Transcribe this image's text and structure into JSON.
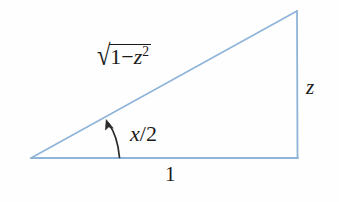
{
  "figure": {
    "kind": "right-triangle-geometry-diagram",
    "background_color": "#fefefe",
    "stroke_color": "#8fb4d9",
    "text_color": "#1a1a1a",
    "arrow_color": "#2b2b2b"
  },
  "labels": {
    "hypotenuse": {
      "text": "√(1−z²)",
      "radical_symbol": "√",
      "radicand_first": "1",
      "radicand_minus": "−",
      "radicand_var": "z",
      "radicand_exponent": "2"
    },
    "angle": {
      "text": "x/2",
      "var": "x",
      "slash": "/",
      "denominator": "2"
    },
    "opposite_side": {
      "text": "z"
    },
    "base_side": {
      "text": "1"
    }
  },
  "geometry": {
    "vertex_left": [
      31,
      158
    ],
    "vertex_right": [
      298,
      158
    ],
    "vertex_apex": [
      297,
      11
    ],
    "angle_arrow_tail": [
      119,
      157
    ],
    "angle_arrow_head": [
      106,
      120
    ]
  }
}
